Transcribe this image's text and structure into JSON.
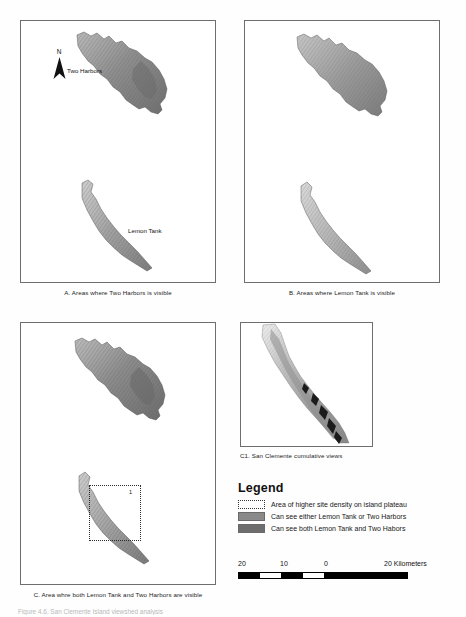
{
  "figure": {
    "bottom_caption": "Figure 4.6. San Clemente Island viewshed analysis"
  },
  "panels": [
    {
      "id": "A",
      "caption": "A. Areas where Two Harbors is visible",
      "labels": [
        "Two Harbors",
        "Lemon Tank"
      ],
      "north_arrow_label": "N"
    },
    {
      "id": "B",
      "caption": "B. Areas where Lemon Tank is visible"
    },
    {
      "id": "C",
      "caption": "C. Area whre both Lemon Tank and Two Harbors are visible",
      "inset_number": "1"
    },
    {
      "id": "C1",
      "caption": "C1. San Clemente cumulative views"
    }
  ],
  "legend": {
    "title": "Legend",
    "items": [
      {
        "label": "Area of higher site density on island plateau",
        "swatch": "dotted-outline",
        "color": "#ffffff"
      },
      {
        "label": "Can see either Lemon Tank or Two Harbors",
        "swatch": "solid-fill",
        "color": "#8a8a8a"
      },
      {
        "label": "Can see both Lemon Tank and Two Habors",
        "swatch": "solid-fill",
        "color": "#6d6d6d"
      }
    ]
  },
  "scalebar": {
    "ticks": [
      "20",
      "10",
      "0",
      "20 Kilometers"
    ],
    "unit": "Kilometers"
  }
}
